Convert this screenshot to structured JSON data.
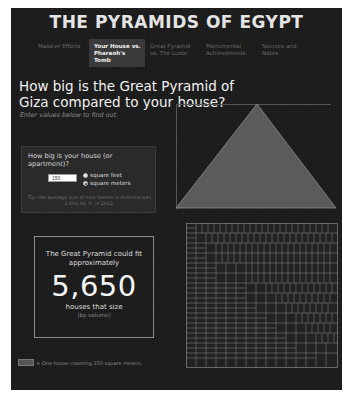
{
  "header": {
    "title": "THE PYRAMIDS OF EGYPT"
  },
  "nav": {
    "items": [
      {
        "label": "Massive Efforts",
        "active": false
      },
      {
        "label": "Your House vs. Pharaoh's Tomb",
        "active": true
      },
      {
        "label": "Great Pyramid vs. The Luxor",
        "active": false
      },
      {
        "label": "Monumental Achievements",
        "active": false
      },
      {
        "label": "Sources and Notes",
        "active": false
      }
    ]
  },
  "main": {
    "heading": "How big is the Great Pyramid of Giza compared to your house?",
    "subtitle": "Enter values below to find out."
  },
  "house_form": {
    "question": "How big is your house (or apartment)?",
    "size_value": "150",
    "units": [
      {
        "label": "square feet",
        "checked": false
      },
      {
        "label": "square meters",
        "checked": true
      }
    ],
    "tip": "Tip: the average size of new homes in America was 2,600 sq. ft. in 2012."
  },
  "result": {
    "lead": "The Great Pyramid could fit approximately",
    "count": "5,650",
    "unit": "houses that size",
    "note": "(by volume)"
  },
  "legend": {
    "label": "= One house covering 150 square meters."
  },
  "colors": {
    "panel_bg": "#1c1c1c",
    "pyramid_fill": "#5a5a5a",
    "pyramid_stroke": "#8a8a8a",
    "grid_stroke": "#7a7a7a",
    "active_tab_bg": "#3a3a3a"
  }
}
